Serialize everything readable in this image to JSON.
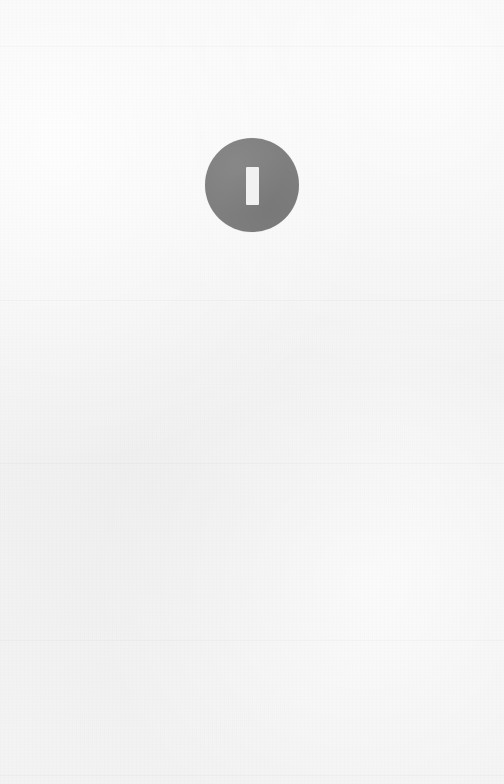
{
  "page": {
    "width": 504,
    "height": 784,
    "background_color": "#f3f3f3",
    "state": "empty",
    "content_text": ""
  },
  "badge": {
    "icon_name": "info-bar-icon",
    "shape": "circle",
    "diameter_px": 94,
    "center_x": 256,
    "center_y": 185,
    "fill_color": "#7f7f7f",
    "glyph": {
      "name": "vertical-bar-glyph",
      "width_px": 13,
      "height_px": 38,
      "fill_color": "#f1f1f1",
      "character": "I"
    },
    "label": ""
  }
}
